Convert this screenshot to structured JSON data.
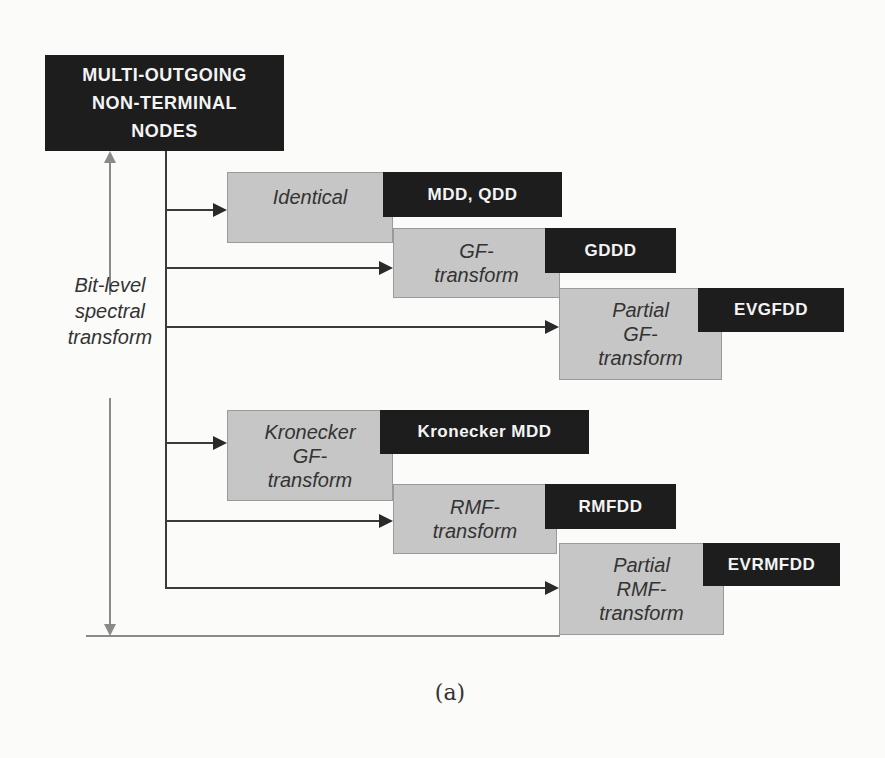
{
  "diagram": {
    "root_node": {
      "lines": [
        "MULTI-OUTGOING",
        "NON-TERMINAL",
        "NODES"
      ]
    },
    "side_label": {
      "lines": [
        "Bit-level",
        "spectral",
        "transform"
      ]
    },
    "transforms": [
      {
        "lines": [
          "Identical"
        ],
        "diagram_type": "MDD, QDD"
      },
      {
        "lines": [
          "GF-",
          "transform"
        ],
        "diagram_type": "GDDD"
      },
      {
        "lines": [
          "Partial",
          "GF-",
          "transform"
        ],
        "diagram_type": "EVGFDD"
      },
      {
        "lines": [
          "Kronecker",
          "GF-",
          "transform"
        ],
        "diagram_type": "Kronecker MDD"
      },
      {
        "lines": [
          "RMF-",
          "transform"
        ],
        "diagram_type": "RMFDD"
      },
      {
        "lines": [
          "Partial",
          "RMF-",
          "transform"
        ],
        "diagram_type": "EVRMFDD"
      }
    ],
    "caption": "(a)",
    "colors": {
      "dark_box": "#1d1d1d",
      "gray_box": "#c6c6c6",
      "connector": "#3a3a3a",
      "axis_arrow": "#8a8a8a"
    }
  }
}
